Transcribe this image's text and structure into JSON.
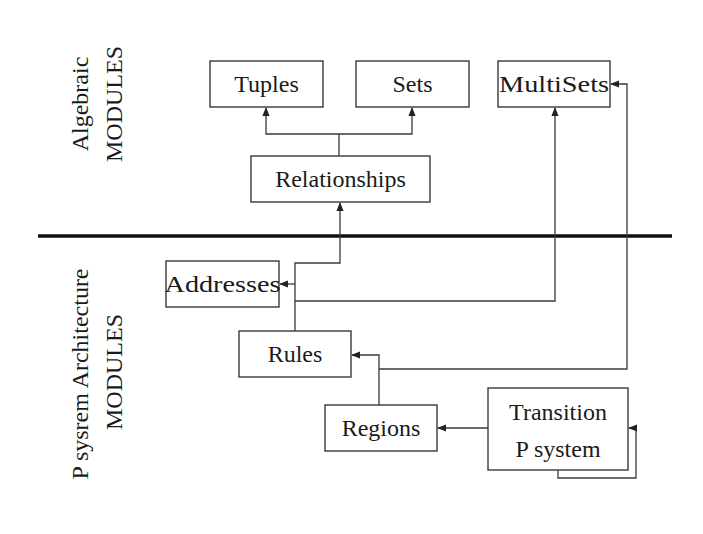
{
  "diagram": {
    "colors": {
      "line": "#3a3a3a",
      "divider": "#111111",
      "text": "#1a1a1a",
      "background": "#ffffff"
    },
    "sections": {
      "algebraic": {
        "line1": "Algebraic",
        "line2": "MODULES"
      },
      "psystem": {
        "line1": "P sysrem Architecture",
        "line2": "MODULES"
      }
    },
    "nodes": {
      "tuples": {
        "label": "Tuples"
      },
      "sets": {
        "label": "Sets"
      },
      "multisets": {
        "label": "MultiSets"
      },
      "relationships": {
        "label": "Relationships"
      },
      "addresses": {
        "label": "Addresses"
      },
      "rules": {
        "label": "Rules"
      },
      "regions": {
        "label": "Regions"
      },
      "transition": {
        "line1": "Transition",
        "line2": "P system"
      }
    },
    "edges": [
      {
        "from": "Relationships",
        "to": "Tuples"
      },
      {
        "from": "Relationships",
        "to": "Sets"
      },
      {
        "from": "Rules",
        "to": "Relationships"
      },
      {
        "from": "Rules",
        "to": "Addresses"
      },
      {
        "from": "Rules",
        "to": "MultiSets"
      },
      {
        "from": "Regions",
        "to": "Rules"
      },
      {
        "from": "Regions",
        "to": "MultiSets"
      },
      {
        "from": "Transition P system",
        "to": "Regions"
      },
      {
        "from": "Transition P system",
        "to": "Transition P system"
      }
    ]
  }
}
